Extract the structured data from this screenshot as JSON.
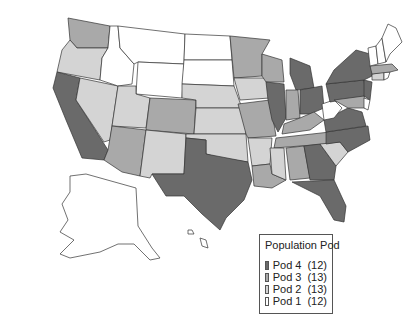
{
  "legend": {
    "title": "Population Pod",
    "items": [
      {
        "label": "Pod 4",
        "count": "(12)",
        "color": "#6a6a6a"
      },
      {
        "label": "Pod 3",
        "count": "(13)",
        "color": "#a9a9a9"
      },
      {
        "label": "Pod 2",
        "count": "(13)",
        "color": "#d4d4d4"
      },
      {
        "label": "Pod 1",
        "count": "(12)",
        "color": "#ffffff"
      }
    ]
  },
  "states": {
    "pod4": [
      "CA",
      "TX",
      "IL",
      "MI",
      "OH",
      "PA",
      "NY",
      "NJ",
      "VA",
      "NC",
      "GA",
      "FL"
    ],
    "pod3": [
      "WA",
      "CO",
      "AZ",
      "MN",
      "WI",
      "MO",
      "IN",
      "KY",
      "TN",
      "AL",
      "LA",
      "MA",
      "MD"
    ],
    "pod2": [
      "OR",
      "NV",
      "UT",
      "NM",
      "NE",
      "KS",
      "OK",
      "IA",
      "AR",
      "MS",
      "SC",
      "WV",
      "CT"
    ],
    "pod1": [
      "MT",
      "ID",
      "WY",
      "ND",
      "SD",
      "ME",
      "NH",
      "VT",
      "AK",
      "HI",
      "RI",
      "DE"
    ]
  }
}
